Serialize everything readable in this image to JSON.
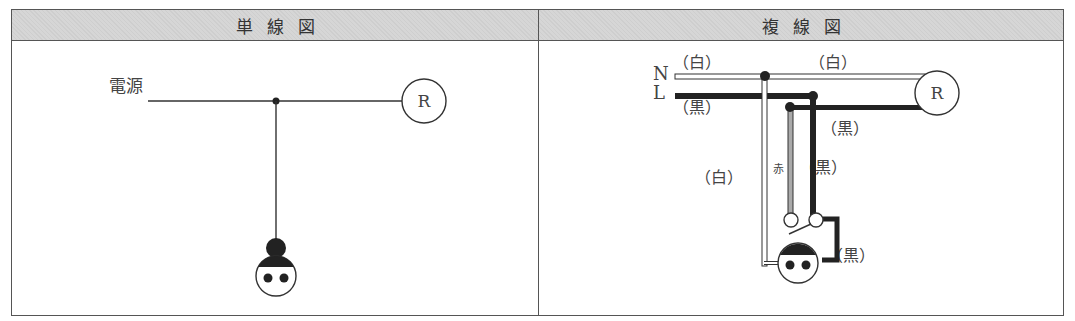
{
  "left_panel": {
    "title": "単線図",
    "source_label": "電源",
    "lamp_label": "R"
  },
  "right_panel": {
    "title": "複線図",
    "neutral_label": "N",
    "line_label": "L",
    "lamp_label": "R",
    "wire_labels": {
      "n_left": "（白）",
      "n_right": "（白）",
      "l_left": "（黒）",
      "lamp_return": "（黒）",
      "switch_white": "（白）",
      "switch_red": "赤",
      "switch_black": "（黒）",
      "outlet_black": "（黒）"
    }
  }
}
